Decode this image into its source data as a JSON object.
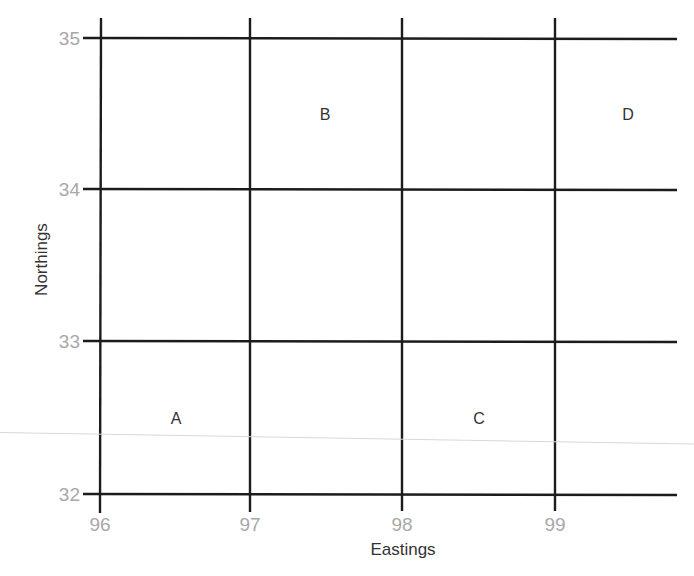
{
  "diagram": {
    "type": "grid-reference-map",
    "x_axis": {
      "title": "Eastings",
      "ticks": [
        "96",
        "97",
        "98",
        "99"
      ],
      "values": [
        96,
        97,
        98,
        99
      ]
    },
    "y_axis": {
      "title": "Northings",
      "ticks": [
        "35",
        "34",
        "33",
        "32"
      ],
      "values": [
        35,
        34,
        33,
        32
      ]
    },
    "squares": [
      {
        "label": "A",
        "easting": 96.5,
        "northing": 32.5
      },
      {
        "label": "B",
        "easting": 97.5,
        "northing": 34.5
      },
      {
        "label": "C",
        "easting": 98.5,
        "northing": 32.5
      },
      {
        "label": "D",
        "easting": 99.5,
        "northing": 34.5
      }
    ],
    "colors": {
      "grid_line": "#1c1c1c",
      "tick_label": "#a8a8a8",
      "text": "#333333",
      "background": "#ffffff"
    }
  }
}
